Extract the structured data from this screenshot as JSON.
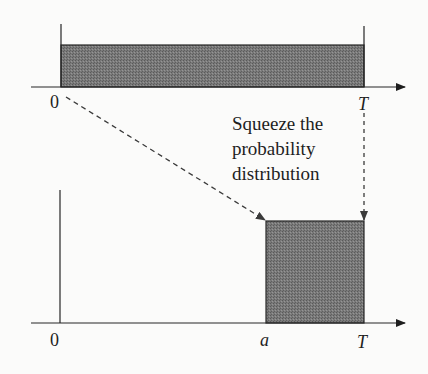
{
  "diagram": {
    "top_panel": {
      "origin_label": "0",
      "end_label": "T",
      "distribution": "uniform on [0, T]"
    },
    "bottom_panel": {
      "origin_label": "0",
      "start_label": "a",
      "end_label": "T",
      "distribution": "uniform on [a, T]"
    },
    "annotation": {
      "lines": [
        "Squeeze the",
        "probability",
        "distribution"
      ]
    },
    "colors": {
      "fill": "#6e6e6e",
      "line": "#262626",
      "dashed": "#3a3a3a"
    }
  }
}
